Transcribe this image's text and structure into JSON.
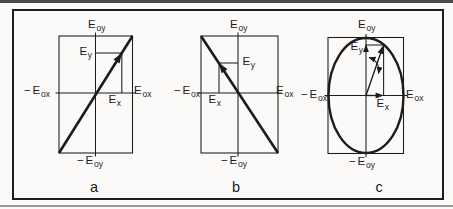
{
  "figure": {
    "ink_color": "#1c1c1c",
    "paper_color": "#fbfaf8"
  },
  "panels": [
    {
      "caption": "a",
      "labels": {
        "axis_top": {
          "pre": "",
          "base": "E",
          "sub": "oy"
        },
        "axis_bottom": {
          "pre": "−",
          "base": "E",
          "sub": "oy"
        },
        "axis_left": {
          "pre": "−",
          "base": "E",
          "sub": "ox"
        },
        "axis_right": {
          "pre": "",
          "base": "E",
          "sub": "ox"
        },
        "component_y": {
          "pre": "",
          "base": "E",
          "sub": "y"
        },
        "component_x": {
          "pre": "",
          "base": "E",
          "sub": "x"
        }
      }
    },
    {
      "caption": "b",
      "labels": {
        "axis_top": {
          "pre": "",
          "base": "E",
          "sub": "oy"
        },
        "axis_bottom": {
          "pre": "−",
          "base": "E",
          "sub": "oy"
        },
        "axis_left": {
          "pre": "−",
          "base": "E",
          "sub": "ox"
        },
        "axis_right": {
          "pre": "",
          "base": "E",
          "sub": "ox"
        },
        "component_y": {
          "pre": "",
          "base": "E",
          "sub": "y"
        },
        "component_x": {
          "pre": "",
          "base": "E",
          "sub": "x"
        }
      }
    },
    {
      "caption": "c",
      "labels": {
        "axis_top": {
          "pre": "",
          "base": "E",
          "sub": "oy"
        },
        "axis_bottom": {
          "pre": "−",
          "base": "E",
          "sub": "oy"
        },
        "axis_left": {
          "pre": "−",
          "base": "E",
          "sub": "ox"
        },
        "axis_right": {
          "pre": "",
          "base": "E",
          "sub": "ox"
        },
        "component_y": {
          "pre": "",
          "base": "E",
          "sub": "y"
        },
        "component_x": {
          "pre": "",
          "base": "E",
          "sub": "x"
        }
      }
    }
  ]
}
